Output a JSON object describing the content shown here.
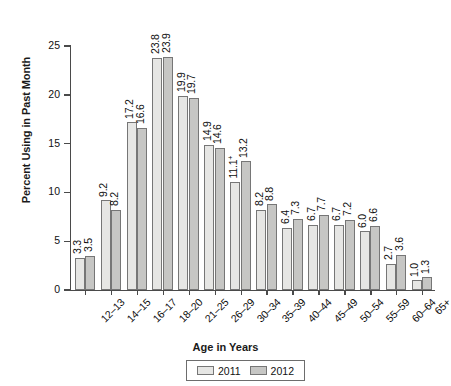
{
  "chart_data": {
    "type": "bar",
    "title": "",
    "xlabel": "Age in Years",
    "ylabel": "Percent Using in Past Month",
    "ylim": [
      0,
      25
    ],
    "yticks": [
      0,
      5,
      10,
      15,
      20,
      25
    ],
    "grid": false,
    "legend_position": "bottom",
    "categories": [
      "12–13",
      "14–15",
      "16–17",
      "18–20",
      "21–25",
      "26–29",
      "30–34",
      "35–39",
      "40–44",
      "45–49",
      "50–54",
      "55–59",
      "60–64",
      "65+"
    ],
    "series": [
      {
        "name": "2011",
        "color": "#e6e6e4",
        "values": [
          3.3,
          9.2,
          17.2,
          23.8,
          19.9,
          14.9,
          11.1,
          8.2,
          6.4,
          6.7,
          6.7,
          6.0,
          2.7,
          1.0
        ],
        "labels": [
          "3.3",
          "9.2",
          "17.2",
          "23.8",
          "19.9",
          "14.9",
          "11.1",
          "8.2",
          "6.4",
          "6.7",
          "6.7",
          "6.0",
          "2.7",
          "1.0"
        ],
        "label_markers": [
          "",
          "",
          "",
          "",
          "",
          "",
          "+",
          "",
          "",
          "",
          "",
          "",
          "",
          ""
        ]
      },
      {
        "name": "2012",
        "color": "#c6c6c4",
        "values": [
          3.5,
          8.2,
          16.6,
          23.9,
          19.7,
          14.6,
          13.2,
          8.8,
          7.3,
          7.7,
          7.2,
          6.6,
          3.6,
          1.3
        ],
        "labels": [
          "3.5",
          "8.2",
          "16.6",
          "23.9",
          "19.7",
          "14.6",
          "13.2",
          "8.8",
          "7.3",
          "7.7",
          "7.2",
          "6.6",
          "3.6",
          "1.3"
        ],
        "label_markers": [
          "",
          "",
          "",
          "",
          "",
          "",
          "",
          "",
          "",
          "",
          "",
          "",
          "",
          ""
        ]
      }
    ]
  },
  "legend": {
    "entries": [
      {
        "label": "2011"
      },
      {
        "label": "2012"
      }
    ]
  }
}
